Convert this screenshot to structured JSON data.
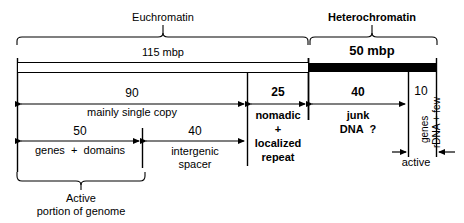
{
  "figure": {
    "type": "genome-composition-diagram",
    "top_braces": [
      {
        "id": "euchromatin",
        "label": "Euchromatin",
        "bold": false,
        "size_label": "115 mbp",
        "size_bold": false,
        "x_start": 17,
        "x_end": 308
      },
      {
        "id": "heterochromatin",
        "label": "Heterochromatin",
        "bold": true,
        "size_label": "50 mbp",
        "size_bold": true,
        "x_start": 308,
        "x_end": 437
      }
    ],
    "bar": {
      "euchromatin_fill": "#ffffff",
      "heterochromatin_fill": "#000000",
      "stroke": "#000000"
    },
    "row1_segments": [
      {
        "id": "single-copy",
        "value": "90",
        "label": "mainly single copy",
        "bold": false,
        "x_start": 17,
        "x_end": 247
      },
      {
        "id": "nomadic-localized-repeat",
        "value": "25",
        "label": "nomadic\n+\nlocalized\nrepeat",
        "bold": true,
        "x_start": 247,
        "x_end": 308
      },
      {
        "id": "junk-dna",
        "value": "40",
        "label": "junk\nDNA  ?",
        "bold": true,
        "x_start": 308,
        "x_end": 408
      },
      {
        "id": "rdna-few-genes",
        "value": "10",
        "label_vertical_1": "rDNA + few",
        "label_vertical_2": "genes",
        "bold": false,
        "x_start": 408,
        "x_end": 437
      }
    ],
    "row2_segments": [
      {
        "id": "genes-domains",
        "value": "50",
        "label": "genes  +  domains",
        "x_start": 17,
        "x_end": 142
      },
      {
        "id": "intergenic-spacer",
        "value": "40",
        "label": "intergenic\nspacer",
        "x_start": 142,
        "x_end": 247
      }
    ],
    "active_sub": {
      "id": "active-rdna",
      "label": "active",
      "x_start": 395,
      "x_end": 437
    },
    "bottom_brace": {
      "id": "active-portion",
      "label": "Active\nportion of genome",
      "x_start": 17,
      "x_end": 145
    }
  }
}
